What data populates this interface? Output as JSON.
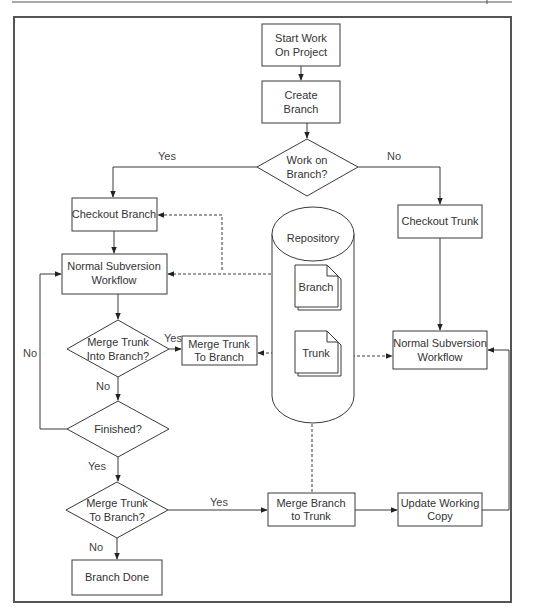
{
  "diagram": {
    "title": "",
    "nodes": {
      "start": {
        "lines": [
          "Start Work",
          "On Project"
        ],
        "shape": "process"
      },
      "create_branch": {
        "lines": [
          "Create",
          "Branch"
        ],
        "shape": "process"
      },
      "work_on_branch": {
        "lines": [
          "Work on",
          "Branch?"
        ],
        "shape": "decision"
      },
      "checkout_branch": {
        "lines": [
          "Checkout Branch"
        ],
        "shape": "process"
      },
      "checkout_trunk": {
        "lines": [
          "Checkout Trunk"
        ],
        "shape": "process"
      },
      "workflow_left": {
        "lines": [
          "Normal Subversion",
          "Workflow"
        ],
        "shape": "process"
      },
      "workflow_right": {
        "lines": [
          "Normal Subversion",
          "Workflow"
        ],
        "shape": "process"
      },
      "repository": {
        "lines": [
          "Repository"
        ],
        "shape": "database"
      },
      "repo_branch": {
        "lines": [
          "Branch"
        ],
        "shape": "document"
      },
      "repo_trunk": {
        "lines": [
          "Trunk"
        ],
        "shape": "document"
      },
      "merge_into_branch_q": {
        "lines": [
          "Merge Trunk",
          "Into Branch?"
        ],
        "shape": "decision"
      },
      "merge_trunk_to_branch": {
        "lines": [
          "Merge Trunk",
          "To Branch"
        ],
        "shape": "process"
      },
      "finished_q": {
        "lines": [
          "Finished?"
        ],
        "shape": "decision"
      },
      "merge_to_branch_q": {
        "lines": [
          "Merge Trunk",
          "To Branch?"
        ],
        "shape": "decision"
      },
      "branch_done": {
        "lines": [
          "Branch Done"
        ],
        "shape": "process"
      },
      "merge_branch_to_trunk": {
        "lines": [
          "Merge Branch",
          "to Trunk"
        ],
        "shape": "process"
      },
      "update_working_copy": {
        "lines": [
          "Update Working",
          "Copy"
        ],
        "shape": "process"
      }
    },
    "edge_labels": {
      "work_yes": "Yes",
      "work_no": "No",
      "merge_into_yes": "Yes",
      "merge_into_no": "No",
      "finished_no": "No",
      "finished_yes": "Yes",
      "merge_to_yes": "Yes",
      "merge_to_no": "No"
    },
    "edges": [
      {
        "from": "start",
        "to": "create_branch",
        "style": "solid"
      },
      {
        "from": "create_branch",
        "to": "work_on_branch",
        "style": "solid"
      },
      {
        "from": "work_on_branch",
        "to": "checkout_branch",
        "label": "Yes",
        "style": "solid"
      },
      {
        "from": "work_on_branch",
        "to": "checkout_trunk",
        "label": "No",
        "style": "solid"
      },
      {
        "from": "checkout_branch",
        "to": "workflow_left",
        "style": "solid"
      },
      {
        "from": "checkout_trunk",
        "to": "workflow_right",
        "style": "solid"
      },
      {
        "from": "repo_branch",
        "to": "checkout_branch",
        "style": "dashed"
      },
      {
        "from": "workflow_left",
        "to": "repo_branch",
        "style": "dashed-bidirectional"
      },
      {
        "from": "workflow_left",
        "to": "merge_into_branch_q",
        "style": "solid"
      },
      {
        "from": "merge_into_branch_q",
        "to": "merge_trunk_to_branch",
        "label": "Yes",
        "style": "solid"
      },
      {
        "from": "repo_trunk",
        "to": "merge_trunk_to_branch",
        "style": "dashed"
      },
      {
        "from": "workflow_right",
        "to": "repo_trunk",
        "style": "dashed-bidirectional"
      },
      {
        "from": "merge_into_branch_q",
        "to": "finished_q",
        "label": "No",
        "style": "solid"
      },
      {
        "from": "finished_q",
        "to": "workflow_left",
        "label": "No",
        "style": "solid"
      },
      {
        "from": "finished_q",
        "to": "merge_to_branch_q",
        "label": "Yes",
        "style": "solid"
      },
      {
        "from": "merge_to_branch_q",
        "to": "merge_branch_to_trunk",
        "label": "Yes",
        "style": "solid"
      },
      {
        "from": "merge_to_branch_q",
        "to": "branch_done",
        "label": "No",
        "style": "solid"
      },
      {
        "from": "merge_branch_to_trunk",
        "to": "repo_trunk",
        "style": "dashed"
      },
      {
        "from": "merge_branch_to_trunk",
        "to": "update_working_copy",
        "style": "solid"
      },
      {
        "from": "update_working_copy",
        "to": "workflow_right",
        "style": "solid"
      }
    ]
  }
}
